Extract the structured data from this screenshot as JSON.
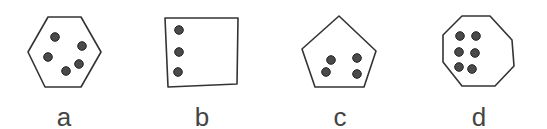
{
  "figure": {
    "colors": {
      "outline": "#333333",
      "dot": "#4a4a4a",
      "dot_stroke": "#222222",
      "label": "#444444"
    },
    "panels": [
      {
        "label": "a",
        "shape": "hexagon",
        "sides": 6,
        "dot_count": 5,
        "points": [
          [
            48,
            17
          ],
          [
            81,
            17
          ],
          [
            101,
            52
          ],
          [
            81,
            87
          ],
          [
            45,
            87
          ],
          [
            28,
            52
          ]
        ],
        "dots": [
          [
            55,
            37
          ],
          [
            82,
            46
          ],
          [
            48,
            57
          ],
          [
            79,
            64
          ],
          [
            66,
            71
          ]
        ],
        "label_pos": [
          64,
          104
        ]
      },
      {
        "label": "b",
        "shape": "square",
        "sides": 4,
        "dot_count": 3,
        "points": [
          [
            165,
            18
          ],
          [
            238,
            18
          ],
          [
            237,
            84
          ],
          [
            168,
            87
          ]
        ],
        "dots": [
          [
            179,
            30
          ],
          [
            179,
            52
          ],
          [
            178,
            72
          ]
        ],
        "label_pos": [
          202,
          104
        ]
      },
      {
        "label": "c",
        "shape": "pentagon",
        "sides": 5,
        "dot_count": 4,
        "points": [
          [
            339,
            16
          ],
          [
            376,
            51
          ],
          [
            364,
            87
          ],
          [
            315,
            87
          ],
          [
            302,
            49
          ]
        ],
        "dots": [
          [
            331,
            60
          ],
          [
            357,
            58
          ],
          [
            326,
            72
          ],
          [
            357,
            74
          ]
        ],
        "label_pos": [
          340,
          104
        ]
      },
      {
        "label": "d",
        "shape": "octagon",
        "sides": 8,
        "dot_count": 6,
        "points": [
          [
            462,
            16
          ],
          [
            490,
            16
          ],
          [
            512,
            40
          ],
          [
            514,
            66
          ],
          [
            495,
            86
          ],
          [
            462,
            86
          ],
          [
            443,
            62
          ],
          [
            443,
            35
          ]
        ],
        "dots": [
          [
            460,
            36
          ],
          [
            476,
            36
          ],
          [
            459,
            52
          ],
          [
            475,
            53
          ],
          [
            459,
            67
          ],
          [
            472,
            69
          ]
        ],
        "label_pos": [
          479,
          104
        ]
      }
    ]
  }
}
